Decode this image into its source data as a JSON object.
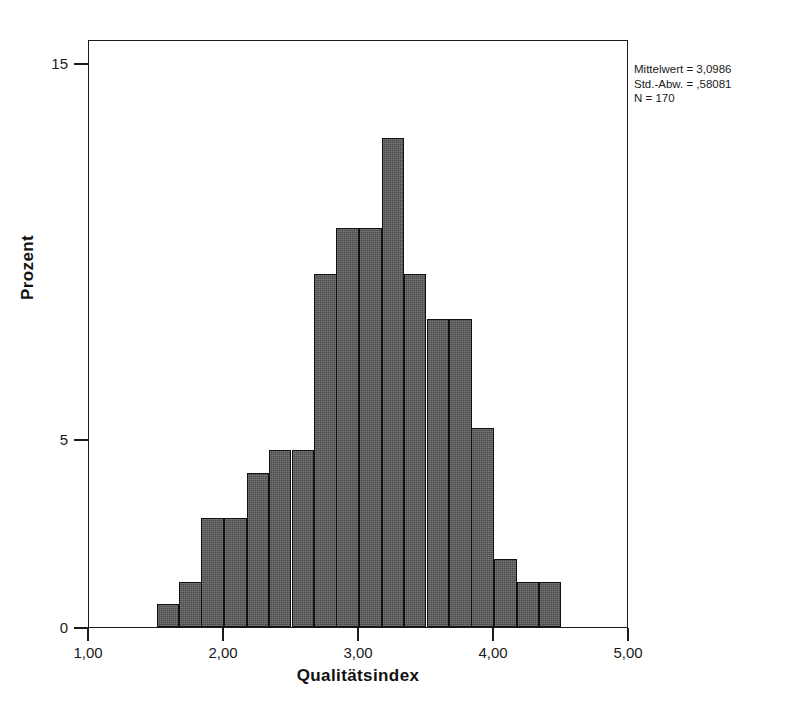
{
  "chart_data": {
    "type": "bar",
    "title": "",
    "subtitle": "",
    "xlabel": "Qualitätsindex",
    "ylabel": "Prozent",
    "xlim": [
      1.0,
      5.0
    ],
    "ylim": [
      0,
      15.5
    ],
    "grid": false,
    "legend": null,
    "bin_width": 0.1667,
    "bar_color": "#5a5a5a",
    "bar_edge_color": "#111111",
    "x_tick_labels": [
      "1,00",
      "2,00",
      "3,00",
      "4,00",
      "5,00"
    ],
    "x_tick_values": [
      1.0,
      2.0,
      3.0,
      4.0,
      5.0
    ],
    "y_tick_labels": [
      "0",
      "5",
      "15"
    ],
    "y_tick_values": [
      0,
      5,
      15
    ],
    "categories": [
      "1,50-1,67",
      "1,67-1,83",
      "1,83-2,00",
      "2,00-2,17",
      "2,17-2,33",
      "2,33-2,50",
      "2,50-2,67",
      "2,67-2,83",
      "2,83-3,00",
      "3,00-3,17",
      "3,17-3,33",
      "3,33-3,50",
      "3,50-3,67",
      "3,67-3,83",
      "3,83-4,00",
      "4,00-4,17",
      "4,17-4,33",
      "4,33-4,50"
    ],
    "bin_starts": [
      1.5,
      1.67,
      1.83,
      2.0,
      2.17,
      2.33,
      2.5,
      2.67,
      2.83,
      3.0,
      3.17,
      3.33,
      3.5,
      3.67,
      3.83,
      4.0,
      4.17,
      4.33
    ],
    "values": [
      0.6,
      1.2,
      2.9,
      2.9,
      4.1,
      4.7,
      4.7,
      9.4,
      10.6,
      10.6,
      13.0,
      9.4,
      8.2,
      8.2,
      5.3,
      1.8,
      1.2,
      1.2
    ],
    "annotations": {
      "mean_label": "Mittelwert = 3,0986",
      "std_label": "Std.-Abw. = ,58081",
      "n_label": "N = 170",
      "mean_value": 3.0986,
      "std_value": 0.58081,
      "n_value": 170
    }
  },
  "axes": {
    "x_title": "Qualitätsindex",
    "y_title": "Prozent"
  }
}
